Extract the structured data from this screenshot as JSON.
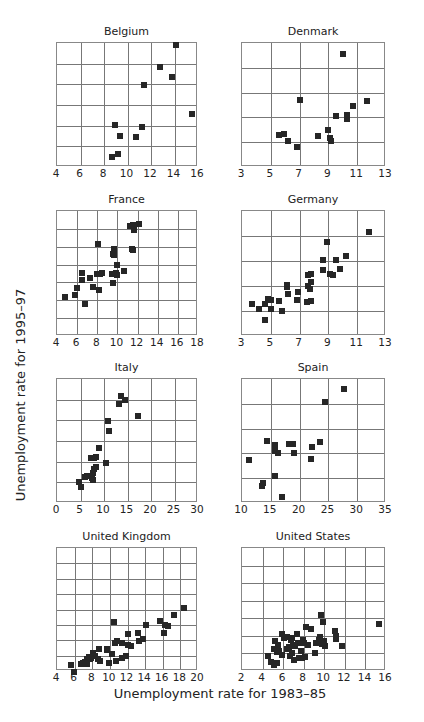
{
  "figure": {
    "ylabel": "Unemployment rate for 1995–97",
    "xlabel": "Unemployment rate for 1983–85"
  },
  "chart_data": [
    {
      "type": "scatter",
      "title": "Belgium",
      "xlabel": "Unemployment rate for 1983–85",
      "ylabel": "Unemployment rate for 1995–97",
      "xlim": [
        4,
        16
      ],
      "ylim": [
        4,
        16
      ],
      "xticks": [
        4,
        6,
        8,
        10,
        12,
        14,
        16
      ],
      "yticks": [
        4,
        6,
        8,
        10,
        12,
        14,
        16
      ],
      "grid": true,
      "points": [
        [
          8.7,
          5.0
        ],
        [
          9.2,
          5.3
        ],
        [
          8.9,
          8.1
        ],
        [
          9.4,
          7.0
        ],
        [
          10.7,
          6.9
        ],
        [
          11.2,
          7.9
        ],
        [
          11.4,
          11.9
        ],
        [
          12.8,
          13.7
        ],
        [
          13.8,
          12.7
        ],
        [
          14.1,
          15.8
        ],
        [
          15.5,
          9.1
        ]
      ]
    },
    {
      "type": "scatter",
      "title": "Denmark",
      "xlabel": "Unemployment rate for 1983–85",
      "ylabel": "Unemployment rate for 1995–97",
      "xlim": [
        3,
        13
      ],
      "ylim": [
        3,
        13
      ],
      "xticks": [
        3,
        5,
        7,
        9,
        11,
        13
      ],
      "yticks": [
        3,
        5,
        7,
        9,
        11,
        13
      ],
      "grid": true,
      "points": [
        [
          5.6,
          5.6
        ],
        [
          5.9,
          5.7
        ],
        [
          6.2,
          5.1
        ],
        [
          6.8,
          4.6
        ],
        [
          7.0,
          8.4
        ],
        [
          8.3,
          5.5
        ],
        [
          9.0,
          6.0
        ],
        [
          9.1,
          5.3
        ],
        [
          9.2,
          5.1
        ],
        [
          9.5,
          7.1
        ],
        [
          10.0,
          12.1
        ],
        [
          10.3,
          6.9
        ],
        [
          10.3,
          7.2
        ],
        [
          10.7,
          7.9
        ],
        [
          11.7,
          8.3
        ]
      ]
    },
    {
      "type": "scatter",
      "title": "France",
      "xlabel": "Unemployment rate for 1983–85",
      "ylabel": "Unemployment rate for 1995–97",
      "xlim": [
        4,
        18
      ],
      "ylim": [
        4,
        18
      ],
      "xticks": [
        4,
        6,
        8,
        10,
        12,
        14,
        16,
        18
      ],
      "yticks": [
        4,
        6,
        8,
        10,
        12,
        14,
        16,
        18
      ],
      "grid": true,
      "points": [
        [
          4.8,
          8.4
        ],
        [
          5.8,
          8.6
        ],
        [
          6.0,
          9.4
        ],
        [
          6.5,
          10.3
        ],
        [
          6.5,
          11.1
        ],
        [
          6.8,
          7.6
        ],
        [
          7.3,
          10.5
        ],
        [
          7.6,
          9.5
        ],
        [
          8.0,
          11.0
        ],
        [
          8.1,
          14.3
        ],
        [
          8.2,
          9.1
        ],
        [
          8.3,
          10.9
        ],
        [
          8.5,
          11.1
        ],
        [
          9.5,
          11.0
        ],
        [
          9.6,
          13.2
        ],
        [
          9.6,
          9.9
        ],
        [
          9.7,
          13.1
        ],
        [
          9.7,
          13.8
        ],
        [
          9.9,
          11.1
        ],
        [
          10.0,
          12.0
        ],
        [
          10.0,
          10.8
        ],
        [
          10.7,
          11.3
        ],
        [
          11.2,
          16.3
        ],
        [
          11.4,
          13.7
        ],
        [
          11.5,
          13.6
        ],
        [
          11.5,
          16.4
        ],
        [
          11.6,
          15.9
        ],
        [
          12.1,
          16.5
        ]
      ]
    },
    {
      "type": "scatter",
      "title": "Germany",
      "xlabel": "Unemployment rate for 1983–85",
      "ylabel": "Unemployment rate for 1995–97",
      "xlim": [
        3,
        13
      ],
      "ylim": [
        3,
        13
      ],
      "xticks": [
        3,
        5,
        7,
        9,
        11,
        13
      ],
      "yticks": [
        3,
        5,
        7,
        9,
        11,
        13
      ],
      "grid": true,
      "points": [
        [
          3.7,
          5.6
        ],
        [
          4.2,
          5.2
        ],
        [
          4.6,
          5.6
        ],
        [
          4.6,
          4.3
        ],
        [
          4.8,
          6.0
        ],
        [
          5.0,
          5.9
        ],
        [
          5.0,
          5.2
        ],
        [
          5.6,
          5.8
        ],
        [
          5.8,
          5.0
        ],
        [
          6.1,
          7.1
        ],
        [
          6.1,
          6.9
        ],
        [
          6.2,
          6.4
        ],
        [
          6.8,
          5.9
        ],
        [
          6.9,
          6.5
        ],
        [
          7.5,
          5.7
        ],
        [
          7.6,
          7.9
        ],
        [
          7.6,
          7.0
        ],
        [
          7.7,
          6.8
        ],
        [
          7.8,
          8.0
        ],
        [
          7.8,
          7.3
        ],
        [
          7.8,
          5.8
        ],
        [
          8.6,
          9.1
        ],
        [
          8.6,
          8.3
        ],
        [
          8.9,
          10.5
        ],
        [
          9.1,
          8.0
        ],
        [
          9.3,
          7.9
        ],
        [
          9.5,
          9.1
        ],
        [
          9.8,
          8.4
        ],
        [
          10.2,
          9.4
        ],
        [
          11.8,
          11.3
        ]
      ]
    },
    {
      "type": "scatter",
      "title": "Italy",
      "xlabel": "Unemployment rate for 1983–85",
      "ylabel": "Unemployment rate for 1995–97",
      "xlim": [
        0,
        30
      ],
      "ylim": [
        0,
        30
      ],
      "xticks": [
        0,
        5,
        10,
        15,
        20,
        25,
        30
      ],
      "yticks": [
        0,
        5,
        10,
        15,
        20,
        25,
        30
      ],
      "grid": true,
      "points": [
        [
          4.6,
          5.2
        ],
        [
          5.2,
          3.9
        ],
        [
          6.0,
          6.4
        ],
        [
          6.4,
          6.5
        ],
        [
          7.2,
          11.0
        ],
        [
          7.5,
          6.0
        ],
        [
          7.6,
          7.3
        ],
        [
          7.6,
          5.5
        ],
        [
          7.8,
          8.2
        ],
        [
          7.8,
          11.0
        ],
        [
          8.3,
          8.7
        ],
        [
          8.4,
          11.1
        ],
        [
          8.9,
          13.3
        ],
        [
          10.4,
          9.7
        ],
        [
          10.8,
          19.8
        ],
        [
          11.0,
          17.5
        ],
        [
          13.1,
          24.0
        ],
        [
          13.7,
          26.0
        ],
        [
          14.5,
          24.8
        ],
        [
          17.3,
          21.1
        ]
      ]
    },
    {
      "type": "scatter",
      "title": "Spain",
      "xlabel": "Unemployment rate for 1983–85",
      "ylabel": "Unemployment rate for 1995–97",
      "xlim": [
        10,
        35
      ],
      "ylim": [
        10,
        35
      ],
      "xticks": [
        10,
        15,
        20,
        25,
        30,
        35
      ],
      "yticks": [
        10,
        15,
        20,
        25,
        30,
        35
      ],
      "grid": true,
      "points": [
        [
          11.3,
          18.6
        ],
        [
          13.5,
          13.5
        ],
        [
          13.6,
          14.1
        ],
        [
          14.4,
          22.6
        ],
        [
          15.7,
          15.4
        ],
        [
          15.8,
          21.7
        ],
        [
          15.8,
          20.4
        ],
        [
          16.3,
          20.1
        ],
        [
          16.9,
          11.3
        ],
        [
          18.2,
          21.8
        ],
        [
          18.9,
          21.9
        ],
        [
          19.1,
          20.1
        ],
        [
          21.9,
          18.8
        ],
        [
          22.1,
          21.3
        ],
        [
          23.6,
          22.3
        ],
        [
          24.4,
          30.4
        ],
        [
          27.7,
          32.9
        ]
      ]
    },
    {
      "type": "scatter",
      "title": "United Kingdom",
      "xlabel": "Unemployment rate for 1983–85",
      "ylabel": "Unemployment rate for 1995–97",
      "xlim": [
        4,
        20
      ],
      "ylim": [
        4,
        20
      ],
      "xticks": [
        4,
        6,
        8,
        10,
        12,
        14,
        16,
        18,
        20
      ],
      "yticks": [
        4,
        6,
        8,
        10,
        12,
        14,
        16,
        18,
        20
      ],
      "grid": true,
      "points": [
        [
          5.6,
          4.8
        ],
        [
          5.9,
          3.9
        ],
        [
          6.7,
          4.9
        ],
        [
          7.0,
          5.0
        ],
        [
          7.2,
          5.2
        ],
        [
          7.4,
          5.6
        ],
        [
          7.4,
          4.9
        ],
        [
          7.6,
          5.8
        ],
        [
          7.7,
          5.5
        ],
        [
          7.9,
          5.7
        ],
        [
          8.1,
          6.3
        ],
        [
          8.3,
          5.9
        ],
        [
          8.6,
          5.6
        ],
        [
          8.8,
          6.9
        ],
        [
          8.9,
          5.3
        ],
        [
          9.7,
          6.9
        ],
        [
          9.7,
          6.7
        ],
        [
          9.9,
          5.0
        ],
        [
          10.2,
          6.2
        ],
        [
          10.5,
          10.4
        ],
        [
          10.6,
          7.7
        ],
        [
          10.7,
          5.3
        ],
        [
          10.8,
          7.9
        ],
        [
          11.4,
          5.7
        ],
        [
          11.4,
          7.7
        ],
        [
          11.8,
          6.0
        ],
        [
          12.0,
          7.4
        ],
        [
          12.0,
          8.8
        ],
        [
          12.4,
          7.3
        ],
        [
          13.2,
          9.0
        ],
        [
          13.3,
          7.9
        ],
        [
          13.8,
          8.1
        ],
        [
          14.1,
          10.0
        ],
        [
          15.7,
          10.5
        ],
        [
          16.1,
          9.0
        ],
        [
          16.2,
          10.0
        ],
        [
          16.6,
          9.9
        ],
        [
          17.3,
          11.3
        ],
        [
          18.4,
          12.2
        ]
      ]
    },
    {
      "type": "scatter",
      "title": "United States",
      "xlabel": "Unemployment rate for 1983–85",
      "ylabel": "Unemployment rate for 1995–97",
      "xlim": [
        2,
        16
      ],
      "ylim": [
        2,
        16
      ],
      "xticks": [
        2,
        4,
        6,
        8,
        10,
        12,
        14,
        16
      ],
      "yticks": [
        2,
        4,
        6,
        8,
        10,
        12,
        14,
        16
      ],
      "grid": true,
      "points": [
        [
          4.5,
          3.7
        ],
        [
          4.8,
          3.0
        ],
        [
          5.1,
          2.7
        ],
        [
          5.4,
          2.9
        ],
        [
          5.1,
          4.5
        ],
        [
          5.2,
          5.4
        ],
        [
          5.4,
          4.2
        ],
        [
          5.5,
          5.0
        ],
        [
          5.6,
          4.3
        ],
        [
          5.9,
          3.8
        ],
        [
          5.9,
          6.2
        ],
        [
          6.1,
          5.8
        ],
        [
          6.4,
          5.9
        ],
        [
          6.4,
          4.5
        ],
        [
          6.6,
          4.7
        ],
        [
          6.7,
          3.7
        ],
        [
          6.8,
          5.5
        ],
        [
          6.9,
          5.8
        ],
        [
          6.9,
          4.1
        ],
        [
          7.0,
          5.0
        ],
        [
          7.1,
          3.3
        ],
        [
          7.2,
          4.9
        ],
        [
          7.3,
          6.2
        ],
        [
          7.4,
          5.2
        ],
        [
          7.5,
          3.5
        ],
        [
          7.7,
          4.3
        ],
        [
          7.8,
          3.5
        ],
        [
          7.9,
          5.5
        ],
        [
          8.0,
          5.2
        ],
        [
          8.1,
          3.6
        ],
        [
          8.2,
          7.0
        ],
        [
          8.4,
          5.0
        ],
        [
          8.7,
          6.8
        ],
        [
          9.1,
          4.0
        ],
        [
          9.2,
          5.2
        ],
        [
          9.5,
          5.5
        ],
        [
          9.6,
          5.9
        ],
        [
          9.7,
          8.4
        ],
        [
          9.8,
          5.1
        ],
        [
          9.9,
          7.6
        ],
        [
          10.0,
          5.4
        ],
        [
          10.1,
          4.8
        ],
        [
          11.0,
          6.5
        ],
        [
          11.1,
          6.0
        ],
        [
          11.1,
          5.6
        ],
        [
          11.7,
          4.8
        ],
        [
          15.3,
          7.4
        ]
      ]
    }
  ]
}
